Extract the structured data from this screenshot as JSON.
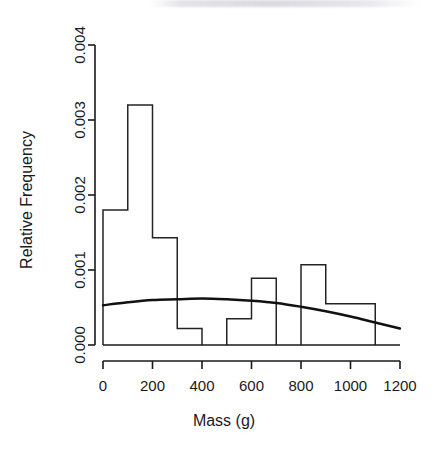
{
  "chart_data": {
    "type": "bar",
    "title": "",
    "subtitle": "",
    "xlabel": "Mass (g)",
    "ylabel": "Relative Frequency",
    "xlim": [
      0,
      1200
    ],
    "ylim": [
      0,
      0.004
    ],
    "grid": false,
    "legend": null,
    "bin_width": 100,
    "bin_edges": [
      0,
      100,
      200,
      300,
      400,
      500,
      600,
      700,
      800,
      900,
      1000,
      1100
    ],
    "categories": [
      "0-100",
      "100-200",
      "200-300",
      "300-400",
      "400-500",
      "500-600",
      "600-700",
      "700-800",
      "800-900",
      "900-1000",
      "1000-1100"
    ],
    "values": [
      0.0018,
      0.0032,
      0.00143,
      0.00022,
      0.0,
      0.00035,
      0.00089,
      0.0,
      0.00107,
      0.00055,
      0.00055
    ],
    "xticks": [
      0,
      200,
      400,
      600,
      800,
      1000,
      1200
    ],
    "xtick_labels": [
      "0",
      "200",
      "400",
      "600",
      "800",
      "1000",
      "1200"
    ],
    "yticks": [
      0.0,
      0.001,
      0.002,
      0.003,
      0.004
    ],
    "ytick_labels": [
      "0.000",
      "0.001",
      "0.002",
      "0.003",
      "0.004"
    ],
    "series": [
      {
        "name": "histogram",
        "type": "bar",
        "values": [
          0.0018,
          0.0032,
          0.00143,
          0.00022,
          0.0,
          0.00035,
          0.00089,
          0.0,
          0.00107,
          0.00055,
          0.00055
        ]
      },
      {
        "name": "fitted-density-curve",
        "type": "line",
        "x": [
          0,
          100,
          200,
          300,
          400,
          500,
          600,
          700,
          800,
          900,
          1000,
          1100,
          1200
        ],
        "values": [
          0.00053,
          0.00057,
          0.0006,
          0.00061,
          0.00062,
          0.00061,
          0.00059,
          0.00056,
          0.00051,
          0.00045,
          0.00038,
          0.0003,
          0.00022
        ]
      }
    ]
  }
}
